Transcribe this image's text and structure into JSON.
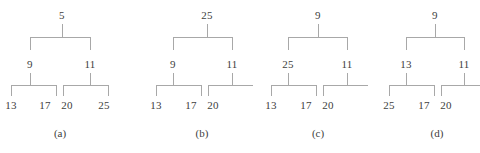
{
  "figure": {
    "background": "#ffffff",
    "line_color": "#a8a8a8",
    "text_color": "#404040",
    "type": "binary-tree-diagrams",
    "count": 4
  },
  "trees": [
    {
      "caption": "(a)",
      "root": "5",
      "level2": {
        "left": "9",
        "right": "11"
      },
      "leaves": {
        "l1": "13",
        "l2": "17",
        "l3": "20",
        "l4": "25"
      }
    },
    {
      "caption": "(b)",
      "root": "25",
      "level2": {
        "left": "9",
        "right": "11"
      },
      "leaves": {
        "l1": "13",
        "l2": "17",
        "l3": "20"
      }
    },
    {
      "caption": "(c)",
      "root": "9",
      "level2": {
        "left": "25",
        "right": "11"
      },
      "leaves": {
        "l1": "13",
        "l2": "17",
        "l3": "20"
      }
    },
    {
      "caption": "(d)",
      "root": "9",
      "level2": {
        "left": "13",
        "right": "11"
      },
      "leaves": {
        "l1": "25",
        "l2": "17",
        "l3": "20"
      }
    }
  ]
}
